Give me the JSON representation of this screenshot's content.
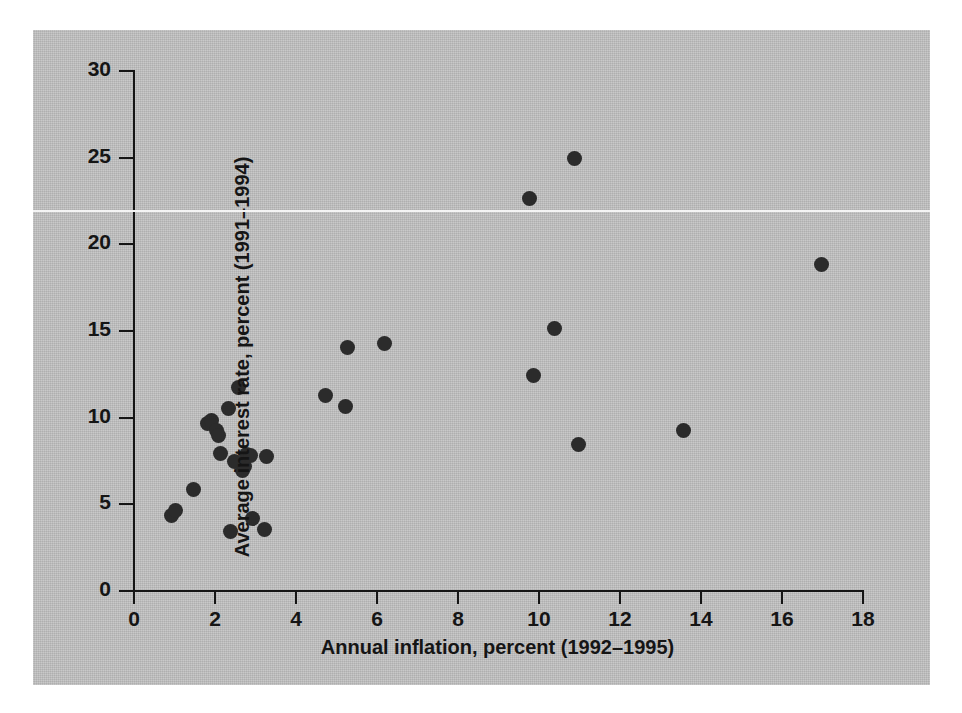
{
  "chart_data": {
    "type": "scatter",
    "title": "",
    "xlabel": "Annual inflation, percent (1992–1995)",
    "ylabel": "Average interest rate, percent (1991–1994)",
    "xlim": [
      0,
      18
    ],
    "ylim": [
      0,
      30
    ],
    "xticks": [
      0,
      2,
      4,
      6,
      8,
      10,
      12,
      14,
      16,
      18
    ],
    "yticks": [
      0,
      5,
      10,
      15,
      20,
      25,
      30
    ],
    "grid": false,
    "legend": null,
    "marker": {
      "shape": "circle",
      "color": "#2b2b2b",
      "size_px": 15
    },
    "background_color": "#c3c3c3",
    "axis_color": "#151515",
    "point_count": 28,
    "points": [
      {
        "x": 0.95,
        "y": 4.3
      },
      {
        "x": 1.05,
        "y": 4.6
      },
      {
        "x": 1.5,
        "y": 5.8
      },
      {
        "x": 1.85,
        "y": 9.6
      },
      {
        "x": 1.95,
        "y": 9.8
      },
      {
        "x": 2.05,
        "y": 9.2
      },
      {
        "x": 2.1,
        "y": 8.9
      },
      {
        "x": 2.15,
        "y": 7.9
      },
      {
        "x": 2.35,
        "y": 10.5
      },
      {
        "x": 2.4,
        "y": 3.4
      },
      {
        "x": 2.5,
        "y": 7.4
      },
      {
        "x": 2.6,
        "y": 11.7
      },
      {
        "x": 2.7,
        "y": 6.9
      },
      {
        "x": 2.75,
        "y": 7.1
      },
      {
        "x": 2.8,
        "y": 7.8
      },
      {
        "x": 2.9,
        "y": 7.75
      },
      {
        "x": 2.95,
        "y": 4.1
      },
      {
        "x": 3.25,
        "y": 3.5
      },
      {
        "x": 3.3,
        "y": 7.7
      },
      {
        "x": 4.75,
        "y": 11.2
      },
      {
        "x": 5.25,
        "y": 10.6
      },
      {
        "x": 5.3,
        "y": 14.0
      },
      {
        "x": 6.2,
        "y": 14.2
      },
      {
        "x": 9.8,
        "y": 22.6
      },
      {
        "x": 9.9,
        "y": 12.4
      },
      {
        "x": 10.4,
        "y": 15.1
      },
      {
        "x": 10.9,
        "y": 24.9
      },
      {
        "x": 11.0,
        "y": 8.4
      },
      {
        "x": 13.6,
        "y": 9.2
      },
      {
        "x": 17.0,
        "y": 18.8
      }
    ]
  }
}
